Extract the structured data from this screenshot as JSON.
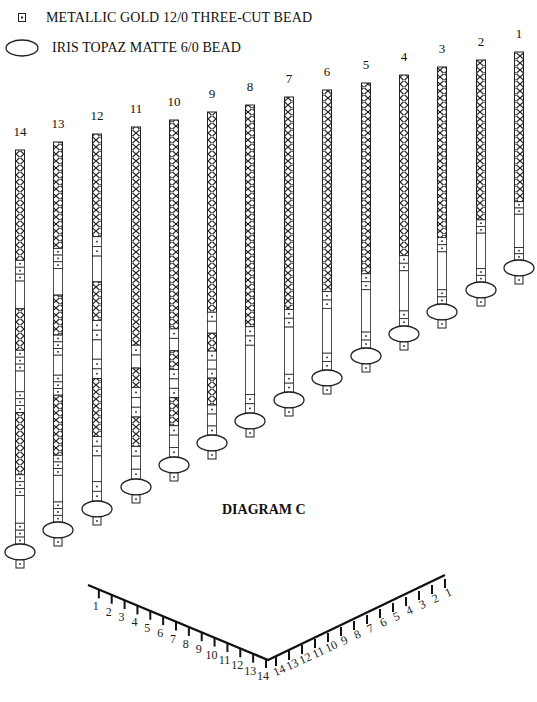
{
  "legend": {
    "items": [
      {
        "icon": "small-square-bead-icon",
        "label": "METALLIC GOLD 12/0 THREE-CUT BEAD"
      },
      {
        "icon": "oval-bead-icon",
        "label": "IRIS TOPAZ MATTE 6/0 BEAD"
      }
    ]
  },
  "diagram": {
    "title": "DIAGRAM C",
    "strands": [
      {
        "label": "1",
        "x": 519,
        "top": 52,
        "oval_y": 268
      },
      {
        "label": "2",
        "x": 481,
        "top": 60,
        "oval_y": 290
      },
      {
        "label": "3",
        "x": 442,
        "top": 67,
        "oval_y": 312
      },
      {
        "label": "4",
        "x": 404,
        "top": 75,
        "oval_y": 334
      },
      {
        "label": "5",
        "x": 366,
        "top": 83,
        "oval_y": 356
      },
      {
        "label": "6",
        "x": 327,
        "top": 90,
        "oval_y": 378
      },
      {
        "label": "7",
        "x": 289,
        "top": 97,
        "oval_y": 400
      },
      {
        "label": "8",
        "x": 250,
        "top": 105,
        "oval_y": 421
      },
      {
        "label": "9",
        "x": 212,
        "top": 112,
        "oval_y": 443
      },
      {
        "label": "10",
        "x": 174,
        "top": 120,
        "oval_y": 465
      },
      {
        "label": "11",
        "x": 136,
        "top": 127,
        "oval_y": 487
      },
      {
        "label": "12",
        "x": 97,
        "top": 134,
        "oval_y": 509
      },
      {
        "label": "13",
        "x": 58,
        "top": 142,
        "oval_y": 530
      },
      {
        "label": "14",
        "x": 20,
        "top": 150,
        "oval_y": 552
      }
    ],
    "v_scale": {
      "left_labels": [
        "1",
        "2",
        "3",
        "4",
        "5",
        "6",
        "7",
        "8",
        "9",
        "10",
        "11",
        "12",
        "13",
        "14"
      ],
      "right_labels": [
        "14",
        "13",
        "12",
        "11",
        "10",
        "9",
        "8",
        "7",
        "6",
        "5",
        "4",
        "3",
        "2",
        "1"
      ]
    }
  }
}
